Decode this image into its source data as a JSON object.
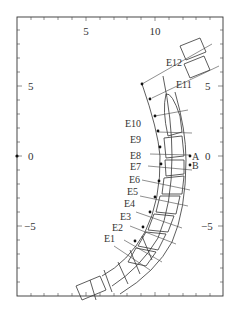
{
  "figure": {
    "x_ticks": [
      {
        "label": "5",
        "x": 86
      },
      {
        "label": "10",
        "x": 155
      }
    ],
    "y_ticks_left": [
      {
        "label": "5",
        "y": 86
      },
      {
        "label": "0",
        "y": 156
      },
      {
        "label": "−5",
        "y": 226
      }
    ],
    "y_ticks_right": [
      {
        "label": "5",
        "y": 86
      },
      {
        "label": "0",
        "y": 156
      },
      {
        "label": "−5",
        "y": 226
      }
    ],
    "electrode_labels": [
      "E1",
      "E2",
      "E3",
      "E4",
      "E5",
      "E6",
      "E7",
      "E8",
      "E9",
      "E10",
      "E11",
      "E12"
    ],
    "point_labels": [
      "A",
      "B"
    ],
    "labels": {
      "x5": "5",
      "x10": "10",
      "yl5": "5",
      "yl0": "0",
      "ylm5": "−5",
      "yr5": "5",
      "yr0": "0",
      "yrm5": "−5",
      "E1": "E1",
      "E2": "E2",
      "E3": "E3",
      "E4": "E4",
      "E5": "E5",
      "E6": "E6",
      "E7": "E7",
      "E8": "E8",
      "E9": "E9",
      "E10": "E10",
      "E11": "E11",
      "E12": "E12",
      "A": "A",
      "B": "B"
    }
  }
}
